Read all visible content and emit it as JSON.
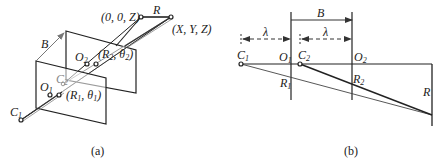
{
  "figure": {
    "panels": [
      {
        "id": "a",
        "caption": "(a)",
        "labels": {
          "origin_point": "(0, 0, Z)",
          "R": "R",
          "target_point": "(X, Y, Z)",
          "B": "B",
          "O2": "O",
          "O2_sub": "2",
          "R2_theta2": "(R",
          "R2_sub": "2",
          "theta2_text": ",  θ",
          "theta2_sub": "2",
          "theta2_close": ")",
          "C2": "C",
          "C2_sub": "2",
          "O1": "O",
          "O1_sub": "1",
          "R1_theta1": "(R",
          "R1_sub": "1",
          "theta1_text": ",  θ",
          "theta1_sub": "1",
          "theta1_close": ")",
          "C1": "C",
          "C1_sub": "1"
        }
      },
      {
        "id": "b",
        "caption": "(b)",
        "labels": {
          "B": "B",
          "lambda1": "λ",
          "lambda2": "λ",
          "C1": "C",
          "C1_sub": "1",
          "O1": "O",
          "O1_sub": "1",
          "C2": "C",
          "C2_sub": "2",
          "O2": "O",
          "O2_sub": "2",
          "R1": "R",
          "R1_sub": "1",
          "R2": "R",
          "R2_sub": "2",
          "R": "R"
        }
      }
    ],
    "colors": {
      "line": "#222222",
      "gray_line": "#888888",
      "background": "#ffffff"
    }
  }
}
